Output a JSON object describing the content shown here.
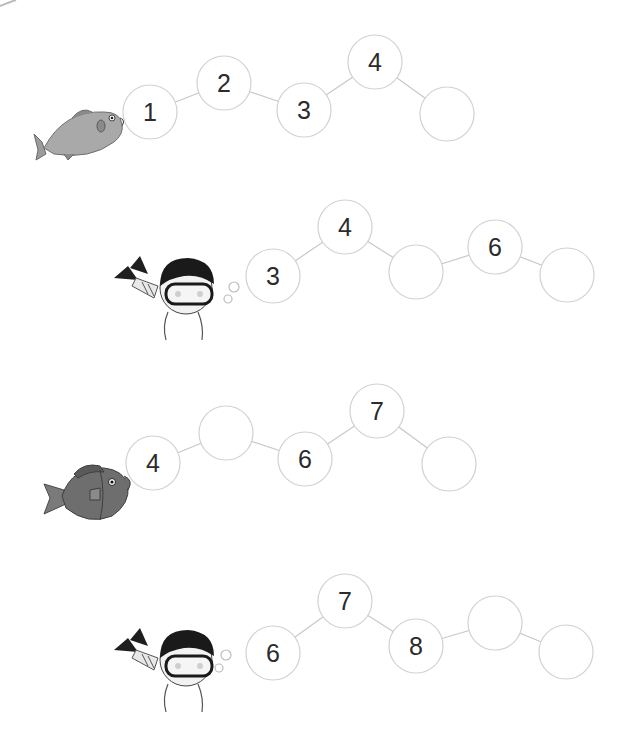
{
  "worksheet": {
    "task": "number sequence - fill in the missing numbers",
    "style": {
      "circle_stroke": "#d2d2d2",
      "circle_fill": "#ffffff",
      "line_color": "#c8c8c8",
      "number_color": "#2b2b2b",
      "fish_light": "#a9a9a9",
      "fish_dark": "#6e6e6e",
      "diver_hair": "#1a1a1a"
    },
    "rows": [
      {
        "character": "light-fish",
        "circles": [
          {
            "label": "1",
            "cx": 150,
            "cy": 112
          },
          {
            "label": "2",
            "cx": 224,
            "cy": 83
          },
          {
            "label": "3",
            "cx": 304,
            "cy": 110
          },
          {
            "label": "4",
            "cx": 375,
            "cy": 62
          },
          {
            "label": "",
            "cx": 447,
            "cy": 114
          }
        ]
      },
      {
        "character": "diver",
        "circles": [
          {
            "label": "3",
            "cx": 273,
            "cy": 276
          },
          {
            "label": "4",
            "cx": 345,
            "cy": 227
          },
          {
            "label": "",
            "cx": 416,
            "cy": 272
          },
          {
            "label": "6",
            "cx": 495,
            "cy": 247
          },
          {
            "label": "",
            "cx": 567,
            "cy": 275
          }
        ]
      },
      {
        "character": "dark-fish",
        "circles": [
          {
            "label": "4",
            "cx": 153,
            "cy": 463
          },
          {
            "label": "",
            "cx": 226,
            "cy": 433
          },
          {
            "label": "6",
            "cx": 305,
            "cy": 459
          },
          {
            "label": "7",
            "cx": 377,
            "cy": 411
          },
          {
            "label": "",
            "cx": 449,
            "cy": 464
          }
        ]
      },
      {
        "character": "diver",
        "circles": [
          {
            "label": "6",
            "cx": 273,
            "cy": 653
          },
          {
            "label": "7",
            "cx": 345,
            "cy": 601
          },
          {
            "label": "8",
            "cx": 416,
            "cy": 646
          },
          {
            "label": "",
            "cx": 495,
            "cy": 623
          },
          {
            "label": "",
            "cx": 566,
            "cy": 652
          }
        ]
      }
    ]
  }
}
